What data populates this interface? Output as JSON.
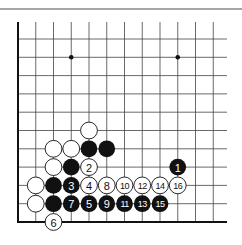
{
  "diagram": {
    "type": "go-board-corner",
    "grid": {
      "columns": 12,
      "rows": 11,
      "origin_x": 18,
      "bottom_y": 222,
      "col_spacing": 17.75,
      "row_spacing": 18.3,
      "edges": [
        "left",
        "bottom"
      ]
    },
    "hoshi": [
      {
        "col": 3,
        "row": 9
      },
      {
        "col": 9,
        "row": 9
      }
    ],
    "stones": [
      {
        "color": "white",
        "col": 4,
        "row": 5,
        "label": ""
      },
      {
        "color": "white",
        "col": 2,
        "row": 4,
        "label": ""
      },
      {
        "color": "white",
        "col": 3,
        "row": 4,
        "label": ""
      },
      {
        "color": "black",
        "col": 4,
        "row": 4,
        "label": ""
      },
      {
        "color": "black",
        "col": 5,
        "row": 4,
        "label": ""
      },
      {
        "color": "white",
        "col": 2,
        "row": 3,
        "label": ""
      },
      {
        "color": "black",
        "col": 3,
        "row": 3,
        "label": ""
      },
      {
        "color": "white",
        "col": 4,
        "row": 3,
        "label": "2"
      },
      {
        "color": "black",
        "col": 9,
        "row": 3,
        "label": "1"
      },
      {
        "color": "white",
        "col": 1,
        "row": 2,
        "label": ""
      },
      {
        "color": "black",
        "col": 2,
        "row": 2,
        "label": ""
      },
      {
        "color": "black",
        "col": 3,
        "row": 2,
        "label": "3"
      },
      {
        "color": "white",
        "col": 4,
        "row": 2,
        "label": "4"
      },
      {
        "color": "white",
        "col": 5,
        "row": 2,
        "label": "8"
      },
      {
        "color": "white",
        "col": 6,
        "row": 2,
        "label": "10"
      },
      {
        "color": "white",
        "col": 7,
        "row": 2,
        "label": "12"
      },
      {
        "color": "white",
        "col": 8,
        "row": 2,
        "label": "14"
      },
      {
        "color": "white",
        "col": 9,
        "row": 2,
        "label": "16"
      },
      {
        "color": "white",
        "col": 1,
        "row": 1,
        "label": ""
      },
      {
        "color": "black",
        "col": 2,
        "row": 1,
        "label": ""
      },
      {
        "color": "black",
        "col": 3,
        "row": 1,
        "label": "7"
      },
      {
        "color": "black",
        "col": 4,
        "row": 1,
        "label": "5"
      },
      {
        "color": "black",
        "col": 5,
        "row": 1,
        "label": "9"
      },
      {
        "color": "black",
        "col": 6,
        "row": 1,
        "label": "11"
      },
      {
        "color": "black",
        "col": 7,
        "row": 1,
        "label": "13"
      },
      {
        "color": "black",
        "col": 8,
        "row": 1,
        "label": "15"
      },
      {
        "color": "white",
        "col": 2,
        "row": 0,
        "label": "6"
      }
    ],
    "colors": {
      "black_stone": "#111111",
      "white_stone": "#ffffff",
      "grid": "#444444",
      "background": "#ffffff"
    }
  }
}
